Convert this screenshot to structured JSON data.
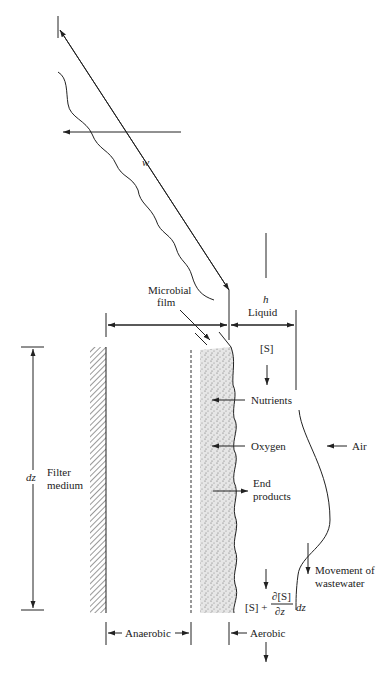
{
  "diagram": {
    "type": "trickling-filter biofilm schematic",
    "colors": {
      "line": "#222222",
      "film": "#d9d9d9",
      "background": "#ffffff"
    },
    "labels": {
      "w": "w",
      "microbial_film_line1": "Microbial",
      "microbial_film_line2": "film",
      "h": "h",
      "liquid": "Liquid",
      "s_top": "[S]",
      "nutrients": "Nutrients",
      "oxygen": "Oxygen",
      "air": "Air",
      "end_products_line1": "End",
      "end_products_line2": "products",
      "dz": "dz",
      "filter_medium_line1": "Filter",
      "filter_medium_line2": "medium",
      "movement_line1": "Movement of",
      "movement_line2": "wastewater",
      "s_bottom_left": "[S] +",
      "partial_num": "∂[S]",
      "partial_den": "∂z",
      "dz_bottom": "dz",
      "anaerobic": "Anaerobic",
      "aerobic": "Aerobic"
    }
  }
}
